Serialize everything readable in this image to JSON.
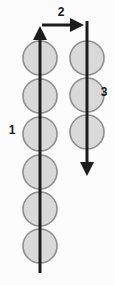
{
  "diagram": {
    "canvas": {
      "width": 115,
      "height": 285,
      "background": "#fcfcfc"
    },
    "colors": {
      "bead_fill": "#d9d9d9",
      "bead_stroke": "#8f8f8f",
      "arrow": "#1c1c1c",
      "label_text": "#1a1a1a"
    },
    "strands": [
      {
        "name": "left-strand",
        "x": 40,
        "bead_radius": 17,
        "beads_y": [
          58,
          96,
          134,
          172,
          209,
          246
        ],
        "line": {
          "from_y": 273,
          "to_y": 26,
          "direction": "up"
        }
      },
      {
        "name": "right-strand",
        "x": 87,
        "bead_radius": 17,
        "beads_y": [
          58,
          95,
          132
        ],
        "line": {
          "from_y": 21,
          "to_y": 176,
          "direction": "down"
        }
      }
    ],
    "connector": {
      "name": "top-connector",
      "y": 25,
      "from_x": 42,
      "to_x": 84,
      "direction": "right"
    },
    "labels": [
      {
        "text": "1",
        "x": 12,
        "y": 130
      },
      {
        "text": "2",
        "x": 61,
        "y": 12
      },
      {
        "text": "3",
        "x": 104,
        "y": 92
      }
    ]
  }
}
